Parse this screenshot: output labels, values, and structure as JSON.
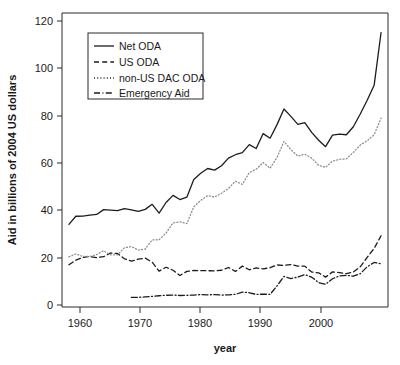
{
  "chart_data": {
    "type": "line",
    "title": "",
    "xlabel": "year",
    "ylabel": "Aid in billions of 2004 US dollars",
    "xlim": [
      1959,
      2006
    ],
    "ylim": [
      -4,
      124
    ],
    "xticks": [
      1960,
      1970,
      1980,
      1990,
      2000
    ],
    "yticks": [
      0,
      20,
      40,
      60,
      80,
      100,
      120
    ],
    "grid": false,
    "legend_position": "top-left",
    "x": [
      1960,
      1961,
      1962,
      1963,
      1964,
      1965,
      1966,
      1967,
      1968,
      1969,
      1970,
      1971,
      1972,
      1973,
      1974,
      1975,
      1976,
      1977,
      1978,
      1979,
      1980,
      1981,
      1982,
      1983,
      1984,
      1985,
      1986,
      1987,
      1988,
      1989,
      1990,
      1991,
      1992,
      1993,
      1994,
      1995,
      1996,
      1997,
      1998,
      1999,
      2000,
      2001,
      2002,
      2003,
      2004,
      2005
    ],
    "series": [
      {
        "name": "Net ODA",
        "style": "solid",
        "color": "#1c1c1c",
        "values": [
          32.0,
          35.5,
          35.6,
          36.0,
          36.3,
          38.4,
          38.2,
          38.0,
          38.8,
          38.3,
          37.6,
          38.5,
          40.7,
          36.9,
          41.5,
          44.6,
          42.8,
          43.8,
          51.5,
          54.2,
          56.3,
          55.6,
          57.5,
          60.8,
          62.3,
          63.2,
          66.7,
          65.0,
          71.5,
          69.5,
          75.4,
          82.2,
          79.0,
          75.5,
          76.3,
          72.0,
          68.6,
          65.8,
          70.8,
          71.3,
          71.0,
          74.5,
          80.0,
          86.0,
          92.5,
          115.5
        ]
      },
      {
        "name": "US ODA",
        "style": "dashed",
        "color": "#1c1c1c",
        "values": [
          14.4,
          16.4,
          17.6,
          18.0,
          17.5,
          17.9,
          19.5,
          19.3,
          17.0,
          16.0,
          16.8,
          17.3,
          15.5,
          11.6,
          13.3,
          12.0,
          9.7,
          11.5,
          11.9,
          11.8,
          11.8,
          11.7,
          12.0,
          13.2,
          11.5,
          13.8,
          12.2,
          13.0,
          12.6,
          13.1,
          14.3,
          14.1,
          14.5,
          13.8,
          13.8,
          11.2,
          10.9,
          9.0,
          11.3,
          11.0,
          10.5,
          11.2,
          13.5,
          17.6,
          21.5,
          27.0
        ]
      },
      {
        "name": "non-US DAC ODA",
        "style": "dotted",
        "color": "#8e8e8e",
        "values": [
          17.8,
          19.1,
          18.0,
          18.0,
          18.8,
          20.5,
          18.7,
          18.7,
          21.8,
          22.3,
          20.8,
          21.2,
          25.2,
          25.3,
          28.2,
          32.6,
          33.1,
          32.3,
          39.6,
          42.4,
          44.5,
          43.9,
          45.5,
          47.6,
          50.8,
          49.4,
          54.5,
          56.0,
          58.9,
          56.4,
          61.1,
          68.1,
          64.5,
          61.7,
          62.5,
          60.8,
          57.7,
          56.8,
          59.5,
          60.3,
          60.5,
          63.3,
          66.5,
          68.4,
          71.0,
          78.2
        ]
      },
      {
        "name": "Emergency Aid",
        "style": "dashdot",
        "color": "#1c1c1c",
        "values": [
          null,
          null,
          null,
          null,
          null,
          null,
          null,
          null,
          null,
          0.15,
          0.2,
          0.4,
          0.6,
          0.9,
          1.1,
          1.2,
          1.0,
          1.1,
          1.2,
          1.4,
          1.3,
          1.4,
          1.2,
          1.3,
          1.5,
          2.5,
          2.2,
          1.5,
          1.6,
          1.5,
          5.2,
          9.3,
          8.4,
          9.0,
          10.1,
          9.0,
          6.6,
          5.9,
          8.3,
          9.5,
          9.8,
          9.4,
          10.5,
          13.5,
          15.4,
          14.8
        ]
      }
    ]
  },
  "axis": {
    "y_title": "Aid in billions of 2004 US dollars",
    "x_title": "year",
    "y_tick_labels": [
      "0",
      "20",
      "40",
      "60",
      "80",
      "100",
      "120"
    ],
    "x_tick_labels": [
      "1960",
      "1970",
      "1980",
      "1990",
      "2000"
    ]
  },
  "legend": {
    "entries": [
      {
        "label": "Net ODA"
      },
      {
        "label": "US ODA"
      },
      {
        "label": "non-US DAC ODA"
      },
      {
        "label": "Emergency Aid"
      }
    ]
  },
  "colors": {
    "axis": "#2b2b2b",
    "solid": "#1c1c1c",
    "dotted": "#8e8e8e",
    "background": "#ffffff"
  }
}
